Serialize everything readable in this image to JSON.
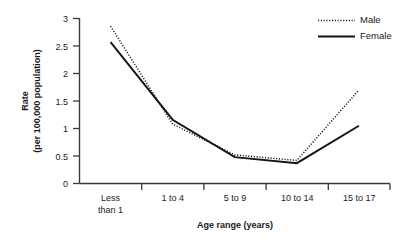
{
  "chart_data": {
    "type": "line",
    "title": "",
    "xlabel": "Age range (years)",
    "ylabel": "Rate (per 100,000 population)",
    "ylabel_line1": "Rate",
    "ylabel_line2": "(per 100,000 population)",
    "categories": [
      "Less than 1",
      "1 to 4",
      "5 to 9",
      "10 to 14",
      "15 to 17"
    ],
    "category_lines": [
      [
        "Less",
        "than 1"
      ],
      [
        "1 to 4"
      ],
      [
        "5 to 9"
      ],
      [
        "10 to 14"
      ],
      [
        "15 to 17"
      ]
    ],
    "series": [
      {
        "name": "Male",
        "style": "dotted",
        "color": "#131313",
        "values": [
          2.86,
          1.08,
          0.52,
          0.42,
          1.7
        ]
      },
      {
        "name": "Female",
        "style": "solid",
        "color": "#131313",
        "values": [
          2.57,
          1.16,
          0.48,
          0.37,
          1.05
        ]
      }
    ],
    "ylim": [
      0,
      3
    ],
    "yticks": [
      0,
      0.5,
      1,
      1.5,
      2,
      2.5,
      3
    ],
    "ytick_labels": [
      "0",
      "0.5",
      "1",
      "1.5",
      "2",
      "2.5",
      "3"
    ],
    "grid": false,
    "legend_position": "top-right",
    "legend": [
      "Male",
      "Female"
    ]
  },
  "legend": {
    "male_label": "Male",
    "female_label": "Female"
  },
  "axes": {
    "y_label_line1": "Rate",
    "y_label_line2": "(per 100,000 population)",
    "x_title": "Age range (years)"
  }
}
